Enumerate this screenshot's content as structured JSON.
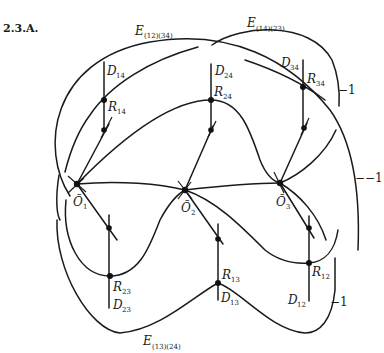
{
  "figure": {
    "title": "2.3.A.",
    "curves": {
      "e_12_34": {
        "main": "E",
        "sub": "(12)(34)"
      },
      "e_14_23": {
        "main": "E",
        "sub": "(14)(23)"
      },
      "e_13_24": {
        "main": "E",
        "sub": "(13)(24)"
      }
    },
    "lines": {
      "d14": {
        "main": "D",
        "sub": "14"
      },
      "d24": {
        "main": "D",
        "sub": "24"
      },
      "d34": {
        "main": "D",
        "sub": "34"
      },
      "d23": {
        "main": "D",
        "sub": "23"
      },
      "d13": {
        "main": "D",
        "sub": "13"
      },
      "d12": {
        "main": "D",
        "sub": "12"
      }
    },
    "points": {
      "r14": {
        "main": "R",
        "sub": "14"
      },
      "r24": {
        "main": "R",
        "sub": "24"
      },
      "r34": {
        "main": "R",
        "sub": "34"
      },
      "r23": {
        "main": "R",
        "sub": "23"
      },
      "r13": {
        "main": "R",
        "sub": "13"
      },
      "r12": {
        "main": "R",
        "sub": "12"
      },
      "o1": {
        "main": "Õ",
        "sub": "1"
      },
      "o2": {
        "main": "Õ",
        "sub": "2"
      },
      "o3": {
        "main": "Õ",
        "sub": "3"
      }
    },
    "self_intersections": {
      "top": "−1",
      "middle": "−−1",
      "bottom": "−1"
    }
  }
}
